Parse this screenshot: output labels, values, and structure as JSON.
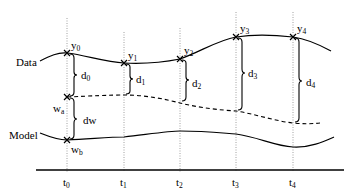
{
  "diagram": {
    "series_labels": {
      "data": "Data",
      "model": "Model"
    },
    "time_points": [
      {
        "t": "t",
        "sub": "0",
        "x": 67
      },
      {
        "t": "t",
        "sub": "1",
        "x": 124
      },
      {
        "t": "t",
        "sub": "2",
        "x": 180
      },
      {
        "t": "t",
        "sub": "3",
        "x": 236
      },
      {
        "t": "t",
        "sub": "4",
        "x": 293
      }
    ],
    "data_points": [
      {
        "name": "y",
        "sub": "0"
      },
      {
        "name": "y",
        "sub": "1"
      },
      {
        "name": "y",
        "sub": "2"
      },
      {
        "name": "y",
        "sub": "3"
      },
      {
        "name": "y",
        "sub": "4"
      }
    ],
    "distances": [
      {
        "name": "d",
        "sub": "0"
      },
      {
        "name": "d",
        "sub": "1"
      },
      {
        "name": "d",
        "sub": "2"
      },
      {
        "name": "d",
        "sub": "3"
      },
      {
        "name": "d",
        "sub": "4"
      }
    ],
    "warp_points": {
      "wa": {
        "name": "w",
        "sub": "a"
      },
      "wb": {
        "name": "w",
        "sub": "b"
      }
    },
    "warp_distance": "dw"
  }
}
